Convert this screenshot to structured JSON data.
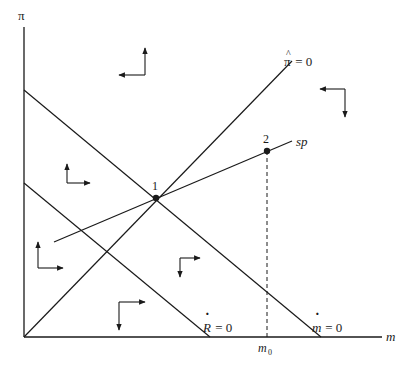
{
  "diagram": {
    "type": "phase-diagram",
    "axes": {
      "y_label": "π",
      "x_label": "m"
    },
    "curves": {
      "pi_hat": {
        "label_symbol": "π",
        "label_rest": " = 0",
        "hat": "^"
      },
      "m_dot": {
        "label_symbol": "m",
        "label_rest": " = 0",
        "dot": "·"
      },
      "r_dot": {
        "label_symbol": "R",
        "label_rest": " = 0",
        "dot": "·"
      },
      "sp": {
        "label": "sp"
      }
    },
    "points": [
      {
        "id": "1",
        "label": "1"
      },
      {
        "id": "2",
        "label": "2"
      }
    ],
    "marker": {
      "label": "m",
      "subscript": "0"
    },
    "arrows": [
      {
        "region": "top-left",
        "vertical": "up",
        "horizontal": "left"
      },
      {
        "region": "top-right",
        "vertical": "down",
        "horizontal": "left"
      },
      {
        "region": "left-middle",
        "vertical": "up",
        "horizontal": "right"
      },
      {
        "region": "left-lower",
        "vertical": "up",
        "horizontal": "right"
      },
      {
        "region": "center-right",
        "vertical": "down",
        "horizontal": "right"
      },
      {
        "region": "bottom",
        "vertical": "down",
        "horizontal": "right"
      }
    ],
    "colors": {
      "ink": "#1a1a1a",
      "background": "#ffffff"
    }
  }
}
